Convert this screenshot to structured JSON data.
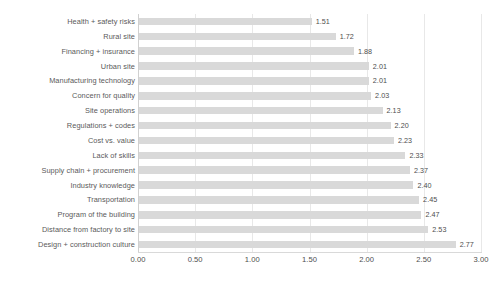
{
  "chart_data": {
    "type": "bar",
    "orientation": "horizontal",
    "title": "",
    "xlabel": "",
    "ylabel": "",
    "xlim": [
      0,
      3
    ],
    "xticks": [
      "0.00",
      "0.50",
      "1.00",
      "1.50",
      "2.00",
      "2.50",
      "3.00"
    ],
    "xtick_values": [
      0,
      0.5,
      1,
      1.5,
      2,
      2.5,
      3
    ],
    "grid": true,
    "grid_axis": "x",
    "legend": false,
    "bar_color": "#d9d9d9",
    "label_color": "#5a5a5a",
    "categories": [
      "Health + safety risks",
      "Rural site",
      "Financing + insurance",
      "Urban site",
      "Manufacturing technology",
      "Concern for quality",
      "Site operations",
      "Regulations + codes",
      "Cost vs. value",
      "Lack of skills",
      "Supply chain + procurement",
      "Industry knowledge",
      "Transportation",
      "Program of the building",
      "Distance from factory to site",
      "Design + construction culture"
    ],
    "values": [
      1.51,
      1.72,
      1.88,
      2.01,
      2.01,
      2.03,
      2.13,
      2.2,
      2.23,
      2.33,
      2.37,
      2.4,
      2.45,
      2.47,
      2.53,
      2.77
    ],
    "value_labels": [
      "1.51",
      "1.72",
      "1.88",
      "2.01",
      "2.01",
      "2.03",
      "2.13",
      "2.20",
      "2.23",
      "2.33",
      "2.37",
      "2.40",
      "2.45",
      "2.47",
      "2.53",
      "2.77"
    ]
  }
}
